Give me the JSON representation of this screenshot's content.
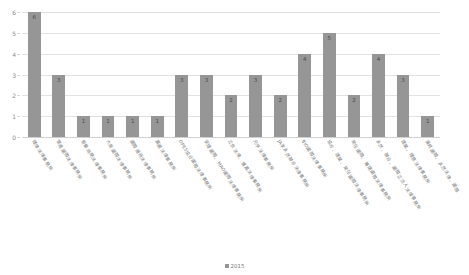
{
  "chart_data": {
    "type": "bar",
    "title": "",
    "xlabel": "",
    "ylabel": "",
    "ylim": [
      0,
      6
    ],
    "yticks": [
      0,
      1,
      2,
      3,
      4,
      5,
      6
    ],
    "grid": true,
    "legend_position": "bottom",
    "legend": [
      "2015"
    ],
    "series_name": "2015",
    "bar_color": "#969696",
    "grid_color": "#e2e2e2",
    "categories": [
      "理律法律事務所",
      "眾達國際法律事務所",
      "普華商務法律事務所",
      "大衆國際法律事務所",
      "國際通商法律事務所",
      "萬國法律事務所",
      "OPES協合國際法律事務所",
      "安理國際、MAO國際法律事務所",
      "立京法律、寰瀛法律事務所",
      "元亨法律事務所",
      "JA李永然聯合法律事務所",
      "BIO國際法律事務所",
      "協合、建業、常在國際法律事務所",
      "常在國際、賽瑞國際法律事務所",
      "永然、聯合、國際正治人法律事務所",
      "建業、理慈法律事務所",
      "漢邦國際、永然法律、國際"
    ],
    "values": [
      6,
      3,
      1,
      1,
      1,
      1,
      3,
      3,
      2,
      3,
      2,
      4,
      5,
      2,
      4,
      3,
      1
    ]
  }
}
